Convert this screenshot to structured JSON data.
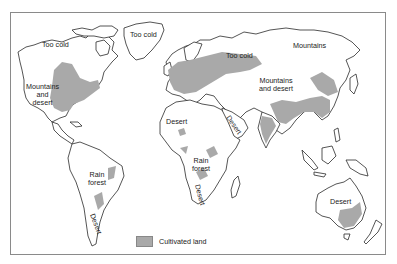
{
  "map": {
    "type": "thematic world map",
    "colors": {
      "cultivated_land": "#a9a9a9",
      "land": "#ffffff",
      "outline": "#2a2a2a",
      "frame": "#8a8a8a"
    },
    "labels": {
      "na_too_cold": "Too cold",
      "greenland_too_cold": "Too cold",
      "na_mountains_desert_1": "Mountains",
      "na_mountains_desert_2": "and",
      "na_mountains_desert_3": "desert",
      "russia_too_cold": "Too cold",
      "siberia_mountains": "Mountains",
      "asia_mountains_desert_1": "Mountains",
      "asia_mountains_desert_2": "and desert",
      "sahara_desert": "Desert",
      "arabia_desert": "Desert",
      "sa_rain_forest_1": "Rain",
      "sa_rain_forest_2": "forest",
      "sa_desert": "Desert",
      "africa_rain_forest_1": "Rain",
      "africa_rain_forest_2": "forest",
      "africa_desert": "Desert",
      "australia_desert": "Desert"
    },
    "legend": {
      "label": "Cultivated land"
    }
  }
}
